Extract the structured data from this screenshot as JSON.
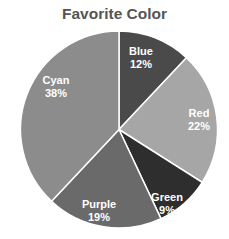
{
  "chart_data": {
    "type": "pie",
    "title": "Favorite Color",
    "categories": [
      "Blue",
      "Red",
      "Green",
      "Purple",
      "Cyan"
    ],
    "values": [
      12,
      22,
      9,
      19,
      38
    ],
    "labels": [
      "12%",
      "22%",
      "9%",
      "19%",
      "38%"
    ],
    "colors": [
      "#4a4a4a",
      "#a6a6a6",
      "#2e2e2e",
      "#6a6a6a",
      "#8c8c8c"
    ],
    "start_angle": "12 o'clock",
    "direction": "clockwise",
    "legend": "none",
    "grid": false
  }
}
